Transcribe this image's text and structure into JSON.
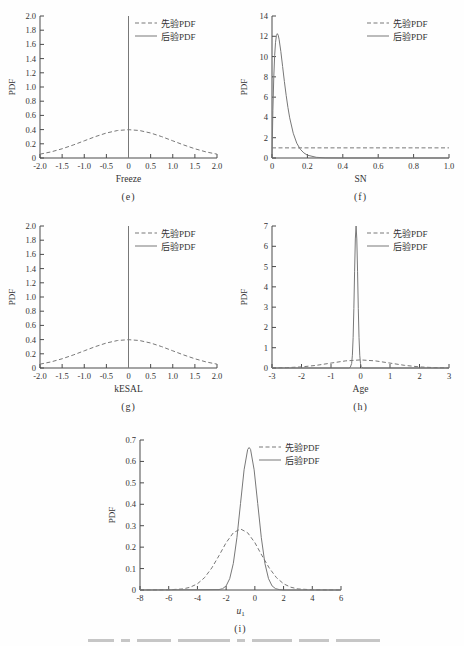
{
  "figure": {
    "background": "#fefefe",
    "line_color": "#787878",
    "axis_color": "#4a4a4a",
    "text_color": "#333333"
  },
  "legend": {
    "prior_label": "先验PDF",
    "posterior_label": "后验PDF"
  },
  "chart_data": [
    {
      "id": "e",
      "type": "line",
      "title": "",
      "xlabel": "Freeze",
      "sublabel": "(e)",
      "ylabel": "PDF",
      "xlim": [
        -2,
        2
      ],
      "ylim": [
        0,
        2
      ],
      "grid": false,
      "legend_position": "top-right",
      "xticks": {
        "values": [
          -2,
          -1.5,
          -1,
          -0.5,
          0,
          0.5,
          1,
          1.5,
          2
        ],
        "labels": [
          "-2.0",
          "-1.5",
          "-1.0",
          "-0.5",
          "0",
          "0.5",
          "1.0",
          "1.5",
          "2.0"
        ]
      },
      "yticks": {
        "values": [
          0,
          0.2,
          0.4,
          0.6,
          0.8,
          1,
          1.2,
          1.4,
          1.6,
          1.8,
          2
        ],
        "labels": [
          "0",
          "0.2",
          "0.4",
          "0.6",
          "0.8",
          "1.0",
          "1.2",
          "1.4",
          "1.6",
          "1.8",
          "2.0"
        ]
      },
      "series": [
        {
          "name": "先验PDF",
          "style": "dashed",
          "points": [
            [
              -2,
              0.054
            ],
            [
              -1.75,
              0.086
            ],
            [
              -1.5,
              0.13
            ],
            [
              -1.25,
              0.183
            ],
            [
              -1,
              0.242
            ],
            [
              -0.75,
              0.301
            ],
            [
              -0.5,
              0.352
            ],
            [
              -0.25,
              0.387
            ],
            [
              0,
              0.399
            ],
            [
              0.25,
              0.387
            ],
            [
              0.5,
              0.352
            ],
            [
              0.75,
              0.301
            ],
            [
              1,
              0.242
            ],
            [
              1.25,
              0.183
            ],
            [
              1.5,
              0.13
            ],
            [
              1.75,
              0.086
            ],
            [
              2,
              0.054
            ]
          ]
        },
        {
          "name": "后验PDF",
          "style": "solid",
          "points": [
            [
              0,
              0
            ],
            [
              0,
              2
            ]
          ]
        }
      ]
    },
    {
      "id": "f",
      "type": "line",
      "title": "",
      "xlabel": "SN",
      "sublabel": "(f)",
      "ylabel": "PDF",
      "xlim": [
        0,
        1
      ],
      "ylim": [
        0,
        14
      ],
      "grid": false,
      "legend_position": "top-right",
      "xticks": {
        "values": [
          0,
          0.2,
          0.4,
          0.6,
          0.8,
          1
        ],
        "labels": [
          "0",
          "0.2",
          "0.4",
          "0.6",
          "0.8",
          "1.0"
        ]
      },
      "yticks": {
        "values": [
          0,
          2,
          4,
          6,
          8,
          10,
          12,
          14
        ],
        "labels": [
          "0",
          "2",
          "4",
          "6",
          "8",
          "10",
          "12",
          "14"
        ]
      },
      "series": [
        {
          "name": "先验PDF",
          "style": "dashed",
          "points": [
            [
              0,
              1
            ],
            [
              1,
              1
            ]
          ]
        },
        {
          "name": "后验PDF",
          "style": "solid",
          "points": [
            [
              0,
              0
            ],
            [
              0.005,
              4.7
            ],
            [
              0.01,
              7.96
            ],
            [
              0.015,
              10.11
            ],
            [
              0.02,
              11.41
            ],
            [
              0.025,
              12.07
            ],
            [
              0.03,
              12.26
            ],
            [
              0.035,
              12.11
            ],
            [
              0.04,
              11.71
            ],
            [
              0.05,
              10.49
            ],
            [
              0.06,
              9.02
            ],
            [
              0.07,
              7.54
            ],
            [
              0.08,
              6.18
            ],
            [
              0.09,
              4.98
            ],
            [
              0.1,
              3.96
            ],
            [
              0.12,
              2.44
            ],
            [
              0.14,
              1.46
            ],
            [
              0.16,
              0.86
            ],
            [
              0.18,
              0.5
            ],
            [
              0.2,
              0.28
            ],
            [
              0.25,
              0.067
            ],
            [
              0.3,
              0.015
            ],
            [
              0.4,
              0.002
            ],
            [
              1,
              0
            ]
          ]
        }
      ]
    },
    {
      "id": "g",
      "type": "line",
      "title": "",
      "xlabel": "kESAL",
      "sublabel": "(g)",
      "ylabel": "PDF",
      "xlim": [
        -2,
        2
      ],
      "ylim": [
        0,
        2
      ],
      "grid": false,
      "legend_position": "top-right",
      "xticks": {
        "values": [
          -2,
          -1.5,
          -1,
          -0.5,
          0,
          0.5,
          1,
          1.5,
          2
        ],
        "labels": [
          "-2.0",
          "-1.5",
          "-1.0",
          "-0.5",
          "0",
          "0.5",
          "1.0",
          "1.5",
          "2.0"
        ]
      },
      "yticks": {
        "values": [
          0,
          0.2,
          0.4,
          0.6,
          0.8,
          1,
          1.2,
          1.4,
          1.6,
          1.8,
          2
        ],
        "labels": [
          "0",
          "0.2",
          "0.4",
          "0.6",
          "0.8",
          "1.0",
          "1.2",
          "1.4",
          "1.6",
          "1.8",
          "2.0"
        ]
      },
      "series": [
        {
          "name": "先验PDF",
          "style": "dashed",
          "points": [
            [
              -2,
              0.054
            ],
            [
              -1.75,
              0.086
            ],
            [
              -1.5,
              0.13
            ],
            [
              -1.25,
              0.183
            ],
            [
              -1,
              0.242
            ],
            [
              -0.75,
              0.301
            ],
            [
              -0.5,
              0.352
            ],
            [
              -0.25,
              0.387
            ],
            [
              0,
              0.399
            ],
            [
              0.25,
              0.387
            ],
            [
              0.5,
              0.352
            ],
            [
              0.75,
              0.301
            ],
            [
              1,
              0.242
            ],
            [
              1.25,
              0.183
            ],
            [
              1.5,
              0.13
            ],
            [
              1.75,
              0.086
            ],
            [
              2,
              0.054
            ]
          ]
        },
        {
          "name": "后验PDF",
          "style": "solid",
          "points": [
            [
              0,
              0
            ],
            [
              0,
              2
            ]
          ]
        }
      ]
    },
    {
      "id": "h",
      "type": "line",
      "title": "",
      "xlabel": "Age",
      "sublabel": "(h)",
      "ylabel": "PDF",
      "xlim": [
        -3,
        3
      ],
      "ylim": [
        0,
        7
      ],
      "grid": false,
      "legend_position": "top-right",
      "xticks": {
        "values": [
          -3,
          -2,
          -1,
          0,
          1,
          2,
          3
        ],
        "labels": [
          "-3",
          "-2",
          "-1",
          "0",
          "1",
          "2",
          "3"
        ]
      },
      "yticks": {
        "values": [
          0,
          1,
          2,
          3,
          4,
          5,
          6,
          7
        ],
        "labels": [
          "0",
          "1",
          "2",
          "3",
          "4",
          "5",
          "6",
          "7"
        ]
      },
      "series": [
        {
          "name": "先验PDF",
          "style": "dashed",
          "points": [
            [
              -3,
              0.004
            ],
            [
              -2.5,
              0.018
            ],
            [
              -2,
              0.054
            ],
            [
              -1.5,
              0.13
            ],
            [
              -1,
              0.242
            ],
            [
              -0.5,
              0.352
            ],
            [
              0,
              0.399
            ],
            [
              0.5,
              0.352
            ],
            [
              1,
              0.242
            ],
            [
              1.5,
              0.13
            ],
            [
              2,
              0.054
            ],
            [
              2.5,
              0.018
            ],
            [
              3,
              0.004
            ]
          ]
        },
        {
          "name": "后验PDF",
          "style": "solid",
          "points": [
            [
              -3,
              0
            ],
            [
              -0.4,
              0
            ],
            [
              -0.35,
              0.02
            ],
            [
              -0.3,
              0.22
            ],
            [
              -0.275,
              0.63
            ],
            [
              -0.25,
              1.5
            ],
            [
              -0.225,
              2.94
            ],
            [
              -0.2,
              4.77
            ],
            [
              -0.175,
              6.36
            ],
            [
              -0.15,
              7
            ],
            [
              -0.125,
              6.36
            ],
            [
              -0.1,
              4.77
            ],
            [
              -0.075,
              2.94
            ],
            [
              -0.05,
              1.5
            ],
            [
              -0.025,
              0.63
            ],
            [
              0,
              0.22
            ],
            [
              0.025,
              0.06
            ],
            [
              0.05,
              0.02
            ],
            [
              0.1,
              0
            ],
            [
              3,
              0
            ]
          ]
        }
      ]
    },
    {
      "id": "i",
      "type": "line",
      "title": "",
      "xlabel": "u",
      "xlabel_sub": "1",
      "xlabel_italic": true,
      "sublabel": "(i)",
      "ylabel": "PDF",
      "xlim": [
        -8,
        6
      ],
      "ylim": [
        0,
        0.7
      ],
      "grid": false,
      "legend_position": "top-right",
      "xticks": {
        "values": [
          -8,
          -6,
          -4,
          -2,
          0,
          2,
          4,
          6
        ],
        "labels": [
          "-8",
          "-6",
          "-4",
          "-2",
          "0",
          "2",
          "4",
          "6"
        ]
      },
      "yticks": {
        "values": [
          0,
          0.1,
          0.2,
          0.3,
          0.4,
          0.5,
          0.6,
          0.7
        ],
        "labels": [
          "0",
          "0.1",
          "0.2",
          "0.3",
          "0.4",
          "0.5",
          "0.6",
          "0.7"
        ]
      },
      "series": [
        {
          "name": "先验PDF",
          "style": "dashed",
          "points": [
            [
              -8,
              0
            ],
            [
              -6,
              0.001
            ],
            [
              -5,
              0.005
            ],
            [
              -4.5,
              0.013
            ],
            [
              -4,
              0.029
            ],
            [
              -3.5,
              0.058
            ],
            [
              -3,
              0.103
            ],
            [
              -2.5,
              0.16
            ],
            [
              -2,
              0.221
            ],
            [
              -1.5,
              0.267
            ],
            [
              -1,
              0.285
            ],
            [
              -0.5,
              0.267
            ],
            [
              0,
              0.221
            ],
            [
              0.5,
              0.16
            ],
            [
              1,
              0.103
            ],
            [
              1.5,
              0.058
            ],
            [
              2,
              0.029
            ],
            [
              2.5,
              0.013
            ],
            [
              3,
              0.005
            ],
            [
              4,
              0.001
            ],
            [
              6,
              0
            ]
          ]
        },
        {
          "name": "后验PDF",
          "style": "solid",
          "points": [
            [
              -8,
              0
            ],
            [
              -2.5,
              0.002
            ],
            [
              -2.25,
              0.006
            ],
            [
              -2,
              0.019
            ],
            [
              -1.75,
              0.053
            ],
            [
              -1.5,
              0.124
            ],
            [
              -1.25,
              0.244
            ],
            [
              -1,
              0.403
            ],
            [
              -0.75,
              0.561
            ],
            [
              -0.5,
              0.656
            ],
            [
              -0.4,
              0.665
            ],
            [
              -0.3,
              0.656
            ],
            [
              -0.05,
              0.561
            ],
            [
              0.2,
              0.403
            ],
            [
              0.45,
              0.244
            ],
            [
              0.7,
              0.124
            ],
            [
              0.95,
              0.053
            ],
            [
              1.2,
              0.019
            ],
            [
              1.45,
              0.006
            ],
            [
              1.7,
              0.002
            ],
            [
              2,
              0
            ],
            [
              6,
              0
            ]
          ]
        }
      ]
    }
  ]
}
